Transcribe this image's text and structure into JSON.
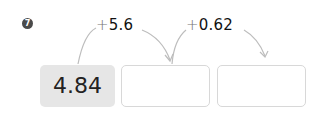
{
  "problem": {
    "number": "7",
    "start_value": "4.84",
    "steps": [
      {
        "operator": "+",
        "operand": "5.6",
        "answer": ""
      },
      {
        "operator": "+",
        "operand": "0.62",
        "answer": ""
      }
    ]
  },
  "colors": {
    "given_box_bg": "#e6e6e6",
    "blank_box_border": "#d8d8d8",
    "arrow": "#bdbdbd",
    "badge": "#4a4a4a"
  }
}
